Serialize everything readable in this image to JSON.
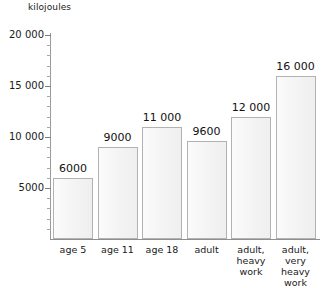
{
  "chart_data": {
    "type": "bar",
    "title": "",
    "subtitle": "",
    "xlabel": "",
    "ylabel": "kilojoules",
    "ylim": [
      0,
      20000
    ],
    "y_major_step": 5000,
    "y_minor_step": 1000,
    "grid": false,
    "legend": null,
    "categories": [
      "age 5",
      "age 11",
      "age 18",
      "adult",
      "adult, heavy work",
      "adult, very heavy work"
    ],
    "category_label_lines": [
      [
        "age 5"
      ],
      [
        "age 11"
      ],
      [
        "age 18"
      ],
      [
        "adult"
      ],
      [
        "adult,",
        "heavy",
        "work"
      ],
      [
        "adult,",
        "very",
        "heavy",
        "work"
      ]
    ],
    "values": [
      6000,
      9000,
      11000,
      9600,
      12000,
      16000
    ],
    "value_labels": [
      "6000",
      "9000",
      "11 000",
      "9600",
      "12 000",
      "16 000"
    ],
    "y_tick_labels": [
      "20 000",
      "15 000",
      "10 000",
      "5000"
    ],
    "y_tick_values": [
      20000,
      15000,
      10000,
      5000
    ],
    "colors": {
      "bar_fill": "#f4f4f4",
      "bar_border": "#b2b2b2",
      "axis": "#8f8f8f",
      "text": "#1a1a1a",
      "background": "#ffffff"
    }
  }
}
